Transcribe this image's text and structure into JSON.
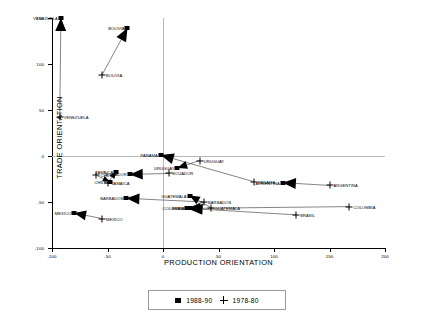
{
  "chart_data": {
    "type": "scatter",
    "title": "",
    "xlabel": "PRODUCTION ORIENTATION",
    "ylabel": "TRADE ORIENTATION",
    "xlim": [
      -100,
      200
    ],
    "ylim": [
      -100,
      150
    ],
    "xticks": [
      -100,
      -50,
      0,
      50,
      100,
      150,
      200
    ],
    "yticks": [
      -100,
      -50,
      0,
      50,
      100,
      150
    ],
    "xticklabels": [
      "-100",
      "-50",
      "0",
      "50",
      "100",
      "150",
      "200"
    ],
    "yticklabels": [
      "-100",
      "-50",
      "0",
      "50",
      "100",
      "150"
    ],
    "grid": "reference lines at x=0 and y=0",
    "legend_position": "below-plot-center",
    "series": [
      {
        "name": "1988-90",
        "marker": "square"
      },
      {
        "name": "1978-80",
        "marker": "plus"
      }
    ],
    "annotation": "arrows point from each 1978-80 (+) position to the matching 1988-90 (filled square) position",
    "points": [
      {
        "label": "VENEZUELA",
        "start_x": -93,
        "start_y": 42,
        "end_x": -92,
        "end_y": 150,
        "start_label_side": "right",
        "end_label_side": "left"
      },
      {
        "label": "BOLIVIA",
        "start_x": -55,
        "start_y": 88,
        "end_x": -32,
        "end_y": 139,
        "start_label_side": "right",
        "end_label_side": "left"
      },
      {
        "label": "PANAMA",
        "start_x": 82,
        "start_y": -28,
        "end_x": -2,
        "end_y": 1,
        "start_label_side": "right",
        "end_label_side": "left"
      },
      {
        "label": "URUGUAY",
        "start_x": 33,
        "start_y": -5,
        "end_x": 13,
        "end_y": -13,
        "start_label_side": "right",
        "end_label_side": "left"
      },
      {
        "label": "ECUADOR",
        "start_x": 5,
        "start_y": -19,
        "end_x": -30,
        "end_y": -20,
        "start_label_side": "right",
        "end_label_side": "left"
      },
      {
        "label": "JAMAICA",
        "start_x": -50,
        "start_y": -29,
        "end_x": -42,
        "end_y": -17,
        "start_label_side": "right",
        "end_label_side": "left"
      },
      {
        "label": "CHILE",
        "start_x": -60,
        "start_y": -21,
        "end_x": -48,
        "end_y": -28,
        "start_label_side": "right",
        "end_label_side": "left"
      },
      {
        "label": "ARGENTINA",
        "start_x": 150,
        "start_y": -32,
        "end_x": 108,
        "end_y": -29,
        "start_label_side": "right",
        "end_label_side": "left"
      },
      {
        "label": "GUATEMALA",
        "start_x": 43,
        "start_y": -56,
        "end_x": 24,
        "end_y": -43,
        "start_label_side": "right",
        "end_label_side": "left"
      },
      {
        "label": "BARBADOS",
        "start_x": 37,
        "start_y": -50,
        "end_x": -33,
        "end_y": -46,
        "start_label_side": "right",
        "end_label_side": "left"
      },
      {
        "label": "MEXICO",
        "start_x": -55,
        "start_y": -68,
        "end_x": -80,
        "end_y": -62,
        "start_label_side": "right",
        "end_label_side": "left"
      },
      {
        "label": "COLOMBIA",
        "start_x": 168,
        "start_y": -55,
        "end_x": 22,
        "end_y": -57,
        "start_label_side": "right",
        "end_label_side": "left"
      },
      {
        "label": "BRASIL",
        "start_x": 120,
        "start_y": -64,
        "end_x": 24,
        "end_y": -57,
        "start_label_side": "right",
        "end_label_side": "left"
      }
    ]
  },
  "legend": {
    "items": [
      {
        "marker": "square",
        "label": "1988-90"
      },
      {
        "marker": "plus",
        "label": "1978-80"
      }
    ]
  }
}
